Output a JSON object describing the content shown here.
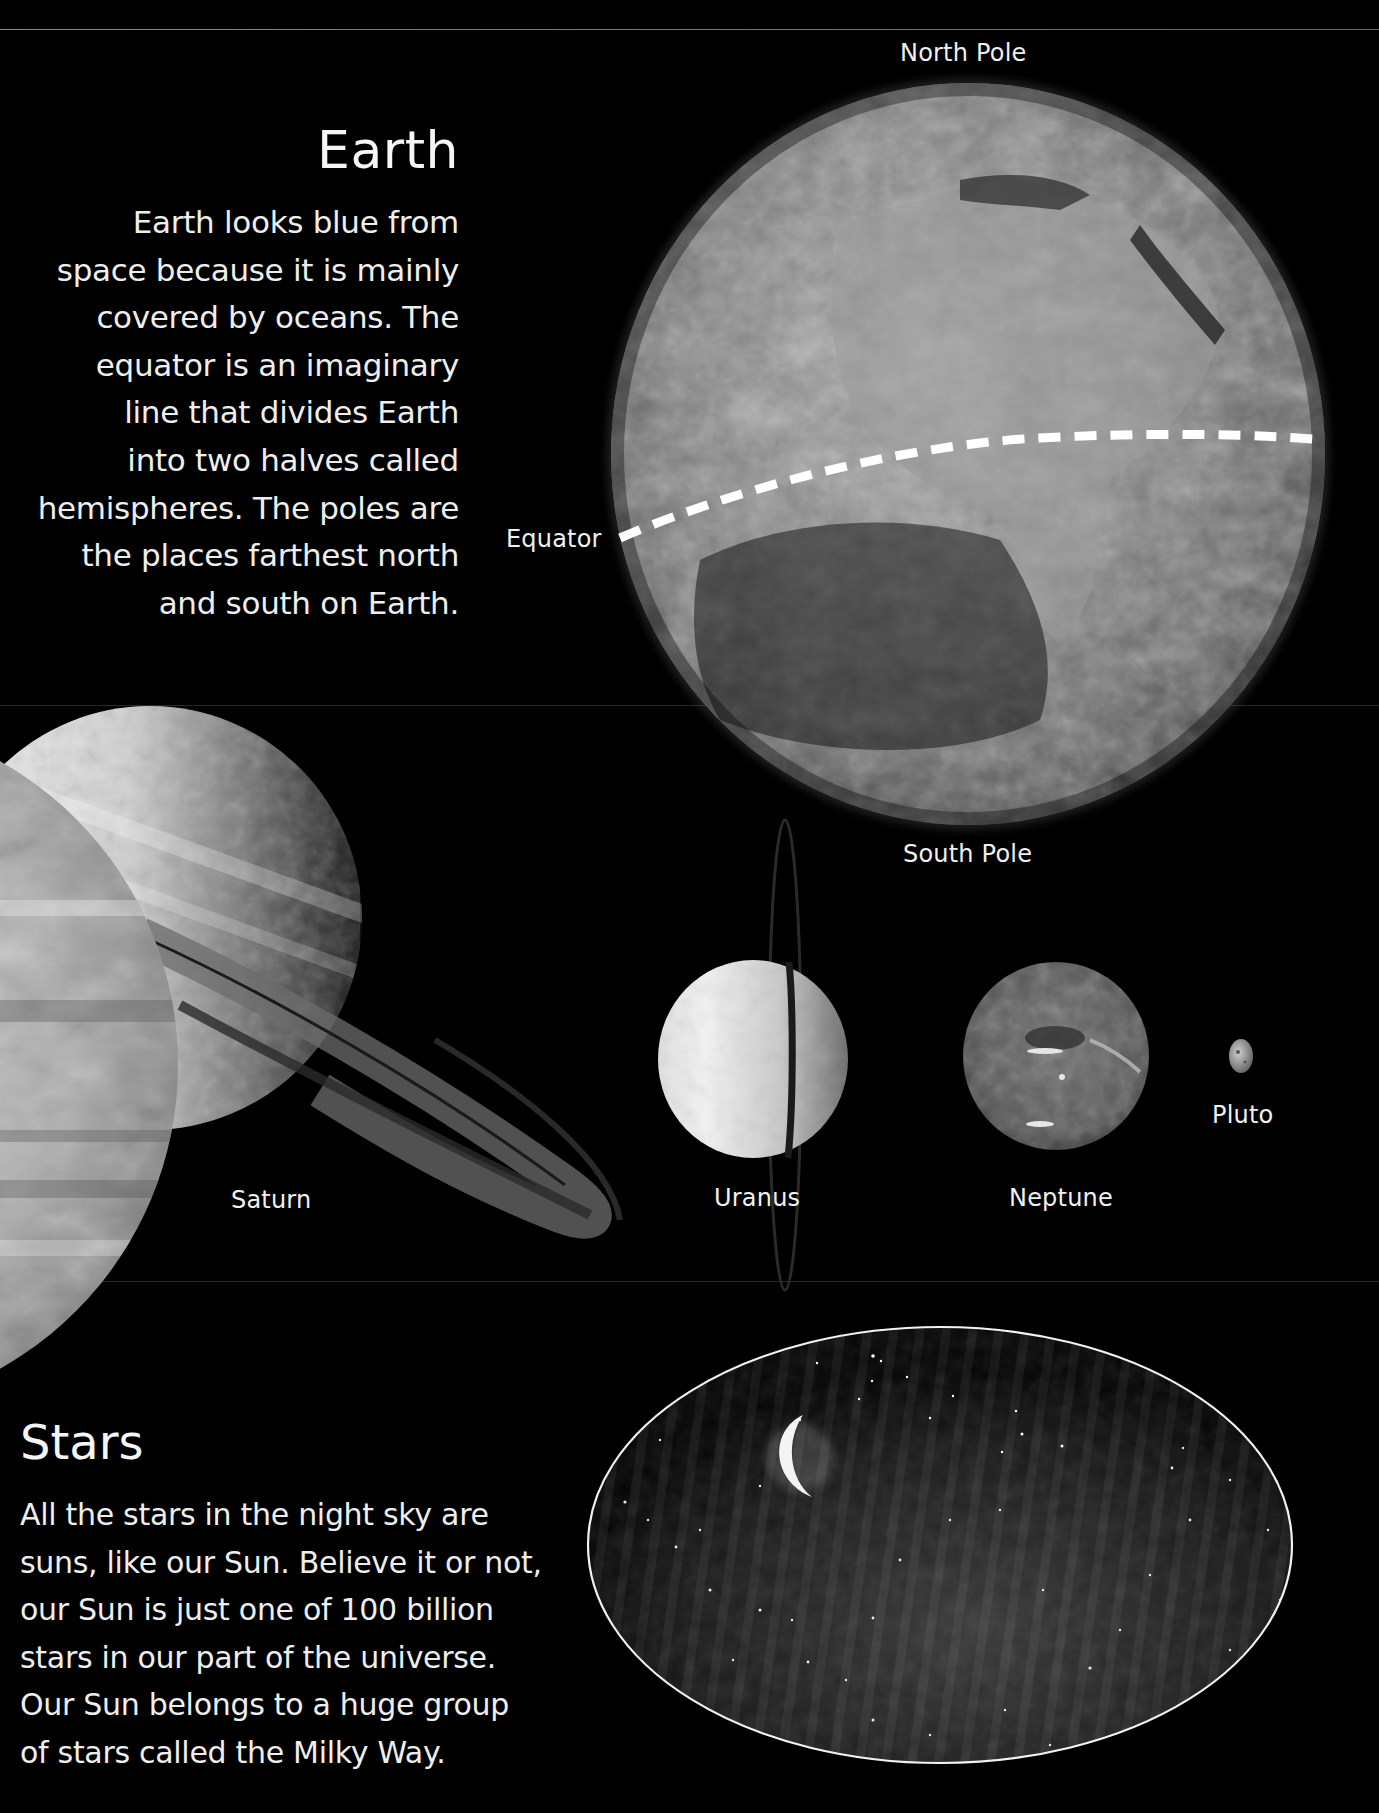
{
  "page": {
    "background_color": "#000000",
    "text_color": "#f2f2f2"
  },
  "earth_section": {
    "heading": "Earth",
    "body_lines": [
      "Earth looks blue from",
      "space because it is mainly",
      "covered by oceans. The",
      "equator is an imaginary",
      "line that divides Earth",
      "into two halves called",
      "hemispheres. The poles are",
      "the places farthest north",
      "and south on Earth."
    ],
    "labels": {
      "north_pole": "North Pole",
      "south_pole": "South Pole",
      "equator": "Equator"
    }
  },
  "planets_section": {
    "planets": [
      {
        "name": "Jupiter",
        "label": ""
      },
      {
        "name": "Saturn",
        "label": "Saturn"
      },
      {
        "name": "Uranus",
        "label": "Uranus"
      },
      {
        "name": "Neptune",
        "label": "Neptune"
      },
      {
        "name": "Pluto",
        "label": "Pluto"
      }
    ]
  },
  "stars_section": {
    "heading": "Stars",
    "body_lines": [
      "All the stars in the night sky are",
      "suns, like our Sun. Believe it or not,",
      "our Sun is just one of 100 billion",
      "stars in our part of the universe.",
      "Our Sun belongs to a huge group",
      "of stars called the Milky Way."
    ]
  }
}
